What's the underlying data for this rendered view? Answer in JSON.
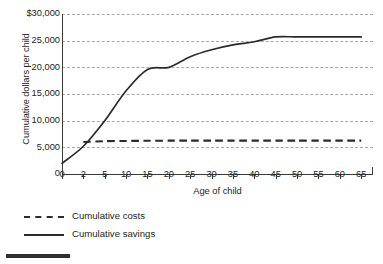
{
  "chart_data": {
    "type": "line",
    "title": "",
    "xlabel": "Age of child",
    "ylabel": "Cumulative dollars per child",
    "grid": true,
    "legend_position": "below-left",
    "x_tick_labels": [
      "0",
      "2",
      "5",
      "10",
      "15",
      "20",
      "25",
      "30",
      "35",
      "40",
      "45",
      "50",
      "55",
      "60",
      "65"
    ],
    "x_tick_values": [
      0,
      2,
      5,
      10,
      15,
      20,
      25,
      30,
      35,
      40,
      45,
      50,
      55,
      60,
      65
    ],
    "x_axis_scale": "categorical-even-spacing",
    "y_tick_labels": [
      "0",
      "5,000",
      "10,000",
      "15,000",
      "20,000",
      "25,000",
      "$30,000"
    ],
    "y_tick_values": [
      0,
      5000,
      10000,
      15000,
      20000,
      25000,
      30000
    ],
    "ylim": [
      0,
      30000
    ],
    "series": [
      {
        "name": "Cumulative costs",
        "style": "dashed",
        "color": "#2b2b2b",
        "x": [
          2,
          5,
          10,
          15,
          20,
          25,
          30,
          35,
          40,
          45,
          50,
          55,
          60,
          65
        ],
        "values": [
          6000,
          6150,
          6200,
          6230,
          6250,
          6250,
          6250,
          6250,
          6250,
          6250,
          6250,
          6250,
          6250,
          6250
        ]
      },
      {
        "name": "Cumulative savings",
        "style": "solid",
        "color": "#2b2b2b",
        "x": [
          0,
          2,
          5,
          10,
          15,
          20,
          25,
          30,
          35,
          40,
          45,
          50,
          55,
          60,
          65
        ],
        "values": [
          2000,
          5200,
          10000,
          15600,
          19600,
          20000,
          22000,
          23300,
          24200,
          24800,
          25700,
          25700,
          25700,
          25700,
          25700
        ]
      }
    ]
  },
  "legend": {
    "items": [
      {
        "label": "Cumulative costs",
        "style": "dashed"
      },
      {
        "label": "Cumulative savings",
        "style": "solid"
      }
    ]
  }
}
